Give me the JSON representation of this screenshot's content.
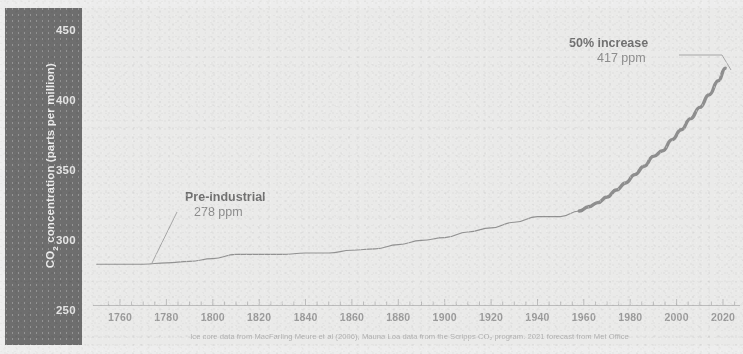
{
  "chart_data": {
    "type": "line",
    "title": "",
    "xlabel": "",
    "ylabel": "CO2 concentration (parts per million)",
    "ylabel_rich": "CO₂ concentration (parts per million)",
    "xlim": [
      1750,
      2025
    ],
    "ylim": [
      250,
      455
    ],
    "yticks": [
      250,
      300,
      350,
      400,
      450
    ],
    "xticks": [
      1760,
      1780,
      1800,
      1820,
      1840,
      1860,
      1880,
      1900,
      1920,
      1940,
      1960,
      1980,
      2000,
      2020
    ],
    "grid": false,
    "legend": false,
    "series": [
      {
        "name": "Ice core record (MacFarling Meure et al. 2006)",
        "style": "thin-line",
        "x": [
          1750,
          1760,
          1770,
          1780,
          1790,
          1800,
          1810,
          1820,
          1830,
          1840,
          1850,
          1860,
          1870,
          1880,
          1890,
          1900,
          1910,
          1920,
          1930,
          1940,
          1950,
          1958
        ],
        "values": [
          277,
          277,
          277,
          278,
          279,
          281,
          284,
          284,
          284,
          285,
          285,
          287,
          288,
          291,
          294,
          296,
          300,
          303,
          307,
          311,
          311,
          315
        ]
      },
      {
        "name": "Mauna Loa record (Scripps CO2 program)",
        "style": "thick-line",
        "x": [
          1958,
          1962,
          1966,
          1970,
          1974,
          1978,
          1982,
          1986,
          1990,
          1994,
          1998,
          2002,
          2006,
          2010,
          2014,
          2018,
          2021
        ],
        "values": [
          315,
          318,
          321,
          325,
          330,
          335,
          341,
          347,
          354,
          358,
          366,
          373,
          381,
          389,
          398,
          408,
          417
        ]
      }
    ],
    "annotations": [
      {
        "id": "pre-industrial",
        "heading": "Pre-industrial",
        "value": "278 ppm",
        "point_year": 1782,
        "point_value": 278
      },
      {
        "id": "current",
        "heading": "50% increase",
        "value": "417 ppm",
        "point_year": 2021,
        "point_value": 417
      }
    ],
    "caption": "Ice core data from MacFarling Meure et al (2006), Mauna Loa data from the Scripps CO₂ program. 2021 forecast from Met Office",
    "colors": {
      "axis_band": "#6a6a6a",
      "plot_background": "#eeeeed",
      "line": "#8f8f8f",
      "tick_text": "#9a9a9a",
      "annotation_text": "#7e7e7e",
      "caption_text": "#b2b2b2"
    }
  }
}
